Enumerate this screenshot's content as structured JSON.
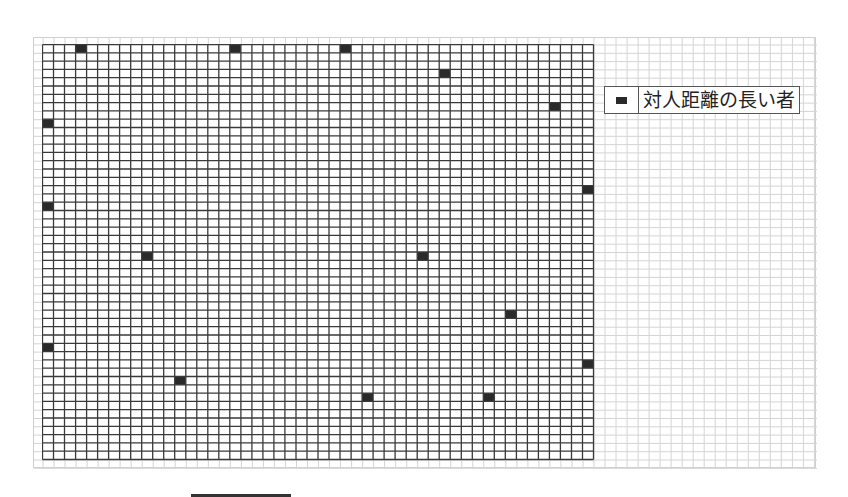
{
  "figure": {
    "grid": {
      "cols": 50,
      "rows": 50,
      "cell_width": 11.02,
      "cell_height": 8.3,
      "line_color": "#3a3a3a",
      "background_line_color": "#d4d4d4"
    },
    "marked_cells": [
      {
        "col": 3,
        "row": 0
      },
      {
        "col": 17,
        "row": 0
      },
      {
        "col": 27,
        "row": 0
      },
      {
        "col": 36,
        "row": 3
      },
      {
        "col": 46,
        "row": 7
      },
      {
        "col": 0,
        "row": 9
      },
      {
        "col": 49,
        "row": 17
      },
      {
        "col": 0,
        "row": 19
      },
      {
        "col": 9,
        "row": 25
      },
      {
        "col": 34,
        "row": 25
      },
      {
        "col": 42,
        "row": 32
      },
      {
        "col": 0,
        "row": 36
      },
      {
        "col": 49,
        "row": 38
      },
      {
        "col": 12,
        "row": 40
      },
      {
        "col": 29,
        "row": 42
      },
      {
        "col": 40,
        "row": 42
      }
    ],
    "marker_color": "#2a2a2a"
  },
  "legend": {
    "items": [
      {
        "label": "対人距離の長い者",
        "icon": "filled-square-icon",
        "color": "#2a2a2a"
      }
    ]
  }
}
